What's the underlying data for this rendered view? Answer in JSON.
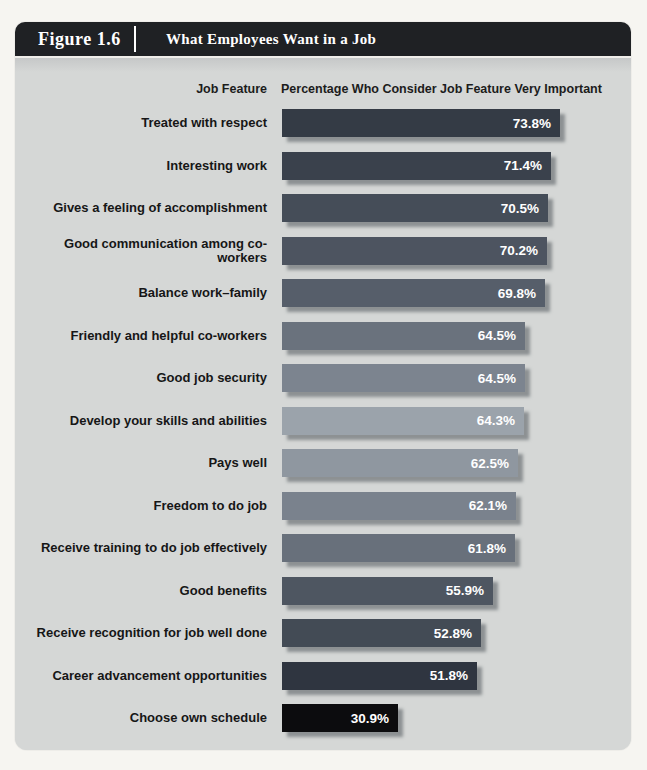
{
  "figure": {
    "label": "Figure 1.6",
    "title": "What Employees Want in a Job"
  },
  "columns": {
    "feature": "Job Feature",
    "percentage": "Percentage Who Consider Job Feature Very Important"
  },
  "chart_data": {
    "type": "bar",
    "orientation": "horizontal",
    "title": "What Employees Want in a Job",
    "xlabel": "Percentage Who Consider Job Feature Very Important",
    "ylabel": "Job Feature",
    "xlim": [
      0,
      100
    ],
    "value_suffix": "%",
    "categories": [
      "Treated with respect",
      "Interesting work",
      "Gives a feeling of accomplishment",
      "Good communication among co-workers",
      "Balance work–family",
      "Friendly and helpful co-workers",
      "Good job security",
      "Develop your skills and abilities",
      "Pays well",
      "Freedom to do job",
      "Receive training to do job effectively",
      "Good benefits",
      "Receive recognition for job well done",
      "Career advancement opportunities",
      "Choose own schedule"
    ],
    "values": [
      73.8,
      71.4,
      70.5,
      70.2,
      69.8,
      64.5,
      64.5,
      64.3,
      62.5,
      62.1,
      61.8,
      55.9,
      52.8,
      51.8,
      30.9
    ],
    "bar_colors": [
      "#343b45",
      "#3a414c",
      "#454d58",
      "#4d5460",
      "#565e6a",
      "#6a727d",
      "#7c848f",
      "#9ba3ab",
      "#8f97a0",
      "#7a828d",
      "#68707b",
      "#4e5661",
      "#434b55",
      "#2f3540",
      "#0c0c0e"
    ],
    "legend": null,
    "grid": false
  },
  "colors": {
    "header_bg": "#1f2124",
    "panel_bg": "#d5d7d6",
    "page_bg": "#f6f5f1",
    "label_text": "#161616",
    "value_text": "#ffffff",
    "header_text": "#ffffff"
  }
}
